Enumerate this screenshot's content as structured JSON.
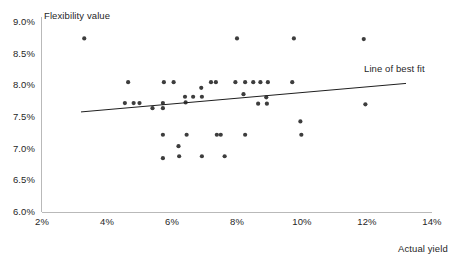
{
  "chart_data": {
    "type": "scatter",
    "title": "",
    "xlabel": "Actual yield",
    "ylabel": "Flexibility value",
    "xlim": [
      2,
      14
    ],
    "ylim": [
      6.0,
      9.0
    ],
    "xticks": [
      "2%",
      "4%",
      "6%",
      "8%",
      "10%",
      "12%",
      "14%"
    ],
    "xtick_values": [
      2,
      4,
      6,
      8,
      10,
      12,
      14
    ],
    "yticks": [
      "6.0%",
      "6.5%",
      "7.0%",
      "7.5%",
      "8.0%",
      "8.5%",
      "9.0%"
    ],
    "ytick_values": [
      6.0,
      6.5,
      7.0,
      7.5,
      8.0,
      8.5,
      9.0
    ],
    "grid": false,
    "legend_position": "inline-annotation",
    "annotations": [
      {
        "text": "Line of best fit",
        "x": 13.15,
        "y": 8.04
      }
    ],
    "series": [
      {
        "name": "Flexibility value vs actual yield",
        "type": "scatter",
        "marker_color": "#3d3d3d",
        "marker_size": 4.2,
        "points": [
          {
            "x": 3.3,
            "y": 8.74
          },
          {
            "x": 4.55,
            "y": 7.72
          },
          {
            "x": 4.65,
            "y": 8.05
          },
          {
            "x": 4.82,
            "y": 7.72
          },
          {
            "x": 5.0,
            "y": 7.72
          },
          {
            "x": 5.4,
            "y": 7.64
          },
          {
            "x": 5.72,
            "y": 7.72
          },
          {
            "x": 5.72,
            "y": 7.64
          },
          {
            "x": 5.72,
            "y": 7.22
          },
          {
            "x": 5.72,
            "y": 6.85
          },
          {
            "x": 5.75,
            "y": 8.05
          },
          {
            "x": 6.05,
            "y": 8.05
          },
          {
            "x": 6.2,
            "y": 7.04
          },
          {
            "x": 6.22,
            "y": 6.88
          },
          {
            "x": 6.4,
            "y": 7.82
          },
          {
            "x": 6.42,
            "y": 7.73
          },
          {
            "x": 6.45,
            "y": 7.22
          },
          {
            "x": 6.65,
            "y": 7.82
          },
          {
            "x": 6.9,
            "y": 7.96
          },
          {
            "x": 6.92,
            "y": 7.82
          },
          {
            "x": 6.92,
            "y": 6.88
          },
          {
            "x": 7.2,
            "y": 8.05
          },
          {
            "x": 7.35,
            "y": 8.05
          },
          {
            "x": 7.38,
            "y": 7.22
          },
          {
            "x": 7.5,
            "y": 7.22
          },
          {
            "x": 7.62,
            "y": 6.88
          },
          {
            "x": 7.95,
            "y": 8.05
          },
          {
            "x": 8.0,
            "y": 8.74
          },
          {
            "x": 8.2,
            "y": 7.86
          },
          {
            "x": 8.25,
            "y": 8.05
          },
          {
            "x": 8.25,
            "y": 7.22
          },
          {
            "x": 8.5,
            "y": 8.05
          },
          {
            "x": 8.65,
            "y": 7.71
          },
          {
            "x": 8.72,
            "y": 8.05
          },
          {
            "x": 8.9,
            "y": 7.81
          },
          {
            "x": 8.92,
            "y": 7.71
          },
          {
            "x": 8.95,
            "y": 8.05
          },
          {
            "x": 9.7,
            "y": 8.05
          },
          {
            "x": 9.75,
            "y": 8.74
          },
          {
            "x": 9.95,
            "y": 7.43
          },
          {
            "x": 9.98,
            "y": 7.22
          },
          {
            "x": 11.9,
            "y": 8.73
          },
          {
            "x": 11.95,
            "y": 7.7
          }
        ]
      },
      {
        "name": "Line of best fit",
        "type": "line",
        "line_color": "#1f1f1f",
        "x": [
          3.2,
          13.2
        ],
        "y": [
          7.58,
          8.03
        ]
      }
    ]
  }
}
